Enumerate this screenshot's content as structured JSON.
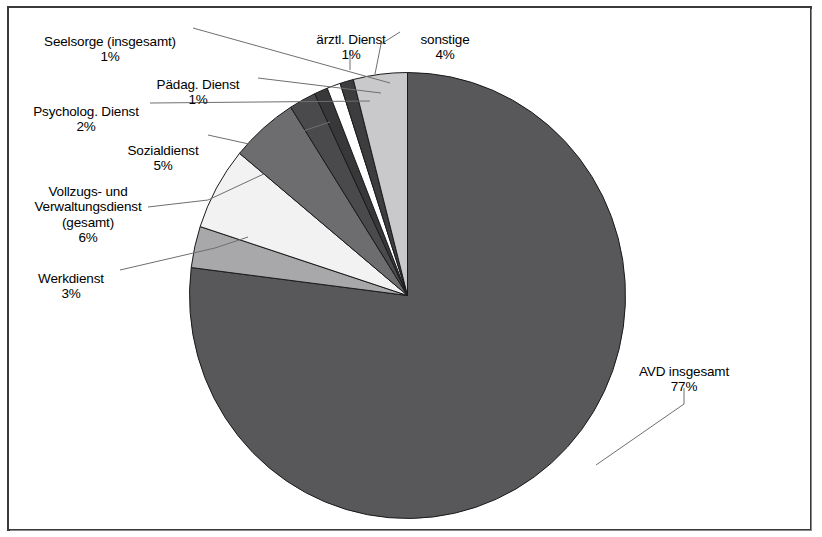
{
  "chart_data": {
    "type": "pie",
    "title": "",
    "subtitle": "",
    "xlabel": "",
    "ylabel": "",
    "legend_position": "none",
    "grid": false,
    "units": "percent",
    "start_angle_deg": 0,
    "direction": "clockwise",
    "categories": [
      "AVD insgesamt",
      "Werkdienst",
      "Vollzugs- und Verwaltungsdienst (gesamt)",
      "Sozialdienst",
      "Psycholog. Dienst",
      "Pädag. Dienst",
      "Seelsorge (insgesamt)",
      "ärztl. Dienst",
      "sonstige"
    ],
    "values": [
      77,
      3,
      6,
      5,
      2,
      1,
      1,
      1,
      4
    ],
    "colors": [
      "#58585a",
      "#a8a8aa",
      "#f2f2f2",
      "#6d6d70",
      "#4a4a4c",
      "#38383a",
      "#ffffff",
      "#3d3d3f",
      "#c9c9cb"
    ],
    "slices": [
      {
        "label": "AVD insgesamt",
        "value": 77,
        "value_text": "77%",
        "color": "#58585a"
      },
      {
        "label": "Werkdienst",
        "value": 3,
        "value_text": "3%",
        "color": "#a8a8aa"
      },
      {
        "label": "Vollzugs- und\nVerwaltungsdienst\n(gesamt)",
        "value": 6,
        "value_text": "6%",
        "color": "#f2f2f2"
      },
      {
        "label": "Sozialdienst",
        "value": 5,
        "value_text": "5%",
        "color": "#6d6d70"
      },
      {
        "label": "Psycholog. Dienst",
        "value": 2,
        "value_text": "2%",
        "color": "#4a4a4c"
      },
      {
        "label": "Pädag. Dienst",
        "value": 1,
        "value_text": "1%",
        "color": "#38383a"
      },
      {
        "label": "Seelsorge (insgesamt)",
        "value": 1,
        "value_text": "1%",
        "color": "#ffffff"
      },
      {
        "label": "ärztl. Dienst",
        "value": 1,
        "value_text": "1%",
        "color": "#3d3d3f"
      },
      {
        "label": "sonstige",
        "value": 4,
        "value_text": "4%",
        "color": "#c9c9cb"
      }
    ]
  },
  "labels": {
    "seelsorge": {
      "name": "Seelsorge (insgesamt)",
      "pct": "1%"
    },
    "paedag": {
      "name": "Pädag. Dienst",
      "pct": "1%"
    },
    "psycholog": {
      "name": "Psycholog. Dienst",
      "pct": "2%"
    },
    "sozialdienst": {
      "name": "Sozialdienst",
      "pct": "5%"
    },
    "vollzugs": {
      "name": "Vollzugs- und\nVerwaltungsdienst\n(gesamt)",
      "pct": "6%"
    },
    "werkdienst": {
      "name": "Werkdienst",
      "pct": "3%"
    },
    "aerztl": {
      "name": "ärztl. Dienst",
      "pct": "1%"
    },
    "sonstige": {
      "name": "sonstige",
      "pct": "4%"
    },
    "avd": {
      "name": "AVD insgesamt",
      "pct": "77%"
    }
  },
  "style": {
    "frame_color": "#3a3a3a",
    "background": "#ffffff",
    "text_color": "#000000",
    "leader_color": "#6f6f6f",
    "slice_edge_color": "#1a1a1a"
  }
}
